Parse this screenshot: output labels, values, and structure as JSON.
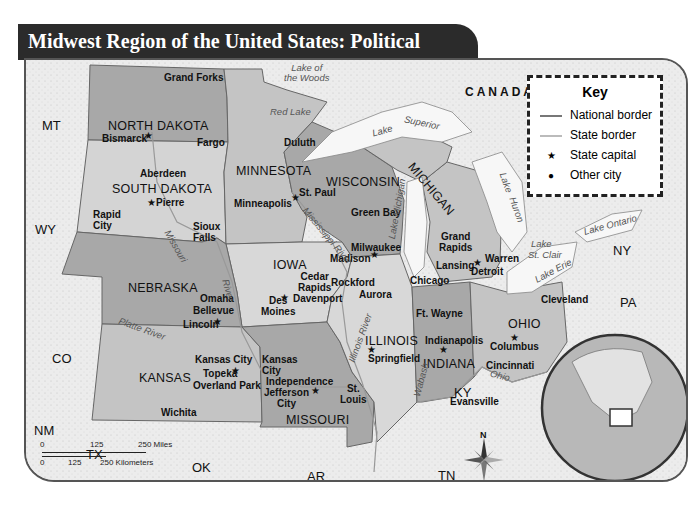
{
  "title": "Midwest Region of the United States: Political",
  "colors": {
    "title_bar": "#2b2b2b",
    "outside_land": "#ececec",
    "midwest_light": "#d6d6d6",
    "midwest_mid": "#bdbdbd",
    "midwest_dark": "#a3a3a3",
    "water": "#f7f7f7",
    "border": "#555555"
  },
  "key": {
    "title": "Key",
    "items": [
      {
        "symbol": "line-dark",
        "label": "National border"
      },
      {
        "symbol": "line-light",
        "label": "State border"
      },
      {
        "symbol": "star",
        "label": "State capital"
      },
      {
        "symbol": "dot",
        "label": "Other city"
      }
    ]
  },
  "country": "CANADA",
  "midwest_states": [
    "NORTH DAKOTA",
    "SOUTH DAKOTA",
    "MINNESOTA",
    "WISCONSIN",
    "MICHIGAN",
    "IOWA",
    "NEBRASKA",
    "KANSAS",
    "MISSOURI",
    "ILLINOIS",
    "INDIANA",
    "OHIO"
  ],
  "neighbor_states": [
    "MT",
    "WY",
    "CO",
    "NM",
    "TX",
    "OK",
    "AR",
    "TN",
    "KY",
    "PA",
    "NY"
  ],
  "capitals": [
    "Bismarck",
    "Pierre",
    "St. Paul",
    "Madison",
    "Lansing",
    "Des Moines",
    "Lincoln",
    "Topeka",
    "Jefferson City",
    "Springfield",
    "Indianapolis",
    "Columbus"
  ],
  "cities": [
    "Grand Forks",
    "Fargo",
    "Aberdeen",
    "Rapid City",
    "Sioux Falls",
    "Duluth",
    "Minneapolis",
    "Green Bay",
    "Milwaukee",
    "Grand Rapids",
    "Detroit",
    "Warren",
    "Cedar Rapids",
    "Davenport",
    "Rockford",
    "Aurora",
    "Chicago",
    "Omaha",
    "Bellevue",
    "Kansas City",
    "Overland Park",
    "Independence",
    "Wichita",
    "St. Louis",
    "Ft. Wayne",
    "Evansville",
    "Cincinnati",
    "Cleveland"
  ],
  "water_features": [
    "Lake of the Woods",
    "Red Lake",
    "Lake Superior",
    "Lake Michigan",
    "Lake Huron",
    "Lake St. Clair",
    "Lake Erie",
    "Lake Ontario",
    "Mississippi River",
    "Missouri River",
    "Platte River",
    "Illinois River",
    "Wabash",
    "Ohio River"
  ],
  "labels": {
    "MT": "MT",
    "WY": "WY",
    "CO": "CO",
    "NM": "NM",
    "TX": "TX",
    "OK": "OK",
    "AR": "AR",
    "TN": "TN",
    "KY": "KY",
    "PA": "PA",
    "NY": "NY",
    "ND": "NORTH DAKOTA",
    "SD": "SOUTH DAKOTA",
    "MN": "MINNESOTA",
    "WI": "WISCONSIN",
    "MI": "MICHIGAN",
    "IA": "IOWA",
    "NE": "NEBRASKA",
    "KS": "KANSAS",
    "MO": "MISSOURI",
    "IL": "ILLINOIS",
    "IN": "INDIANA",
    "OH": "OHIO",
    "grand_forks": "Grand Forks",
    "bismarck": "Bismarck",
    "fargo": "Fargo",
    "aberdeen": "Aberdeen",
    "pierre": "Pierre",
    "rapid": "Rapid",
    "city": "City",
    "sioux": "Sioux",
    "falls": "Falls",
    "duluth": "Duluth",
    "st_paul": "St. Paul",
    "minneapolis": "Minneapolis",
    "green_bay": "Green Bay",
    "milwaukee": "Milwaukee",
    "madison": "Madison",
    "grand": "Grand",
    "rapids": "Rapids",
    "lansing": "Lansing",
    "warren": "Warren",
    "detroit": "Detroit",
    "cedar": "Cedar",
    "des": "Des",
    "moines": "Moines",
    "davenport": "Davenport",
    "rockford": "Rockford",
    "aurora": "Aurora",
    "chicago": "Chicago",
    "omaha": "Omaha",
    "bellevue": "Bellevue",
    "lincoln": "Lincoln",
    "kansas_city": "Kansas City",
    "kansas": "Kansas",
    "topeka": "Topeka",
    "overland_park": "Overland Park",
    "independence": "Independence",
    "jefferson": "Jefferson",
    "wichita": "Wichita",
    "st": "St.",
    "louis": "Louis",
    "springfield": "Springfield",
    "ft_wayne": "Ft. Wayne",
    "indianapolis": "Indianapolis",
    "evansville": "Evansville",
    "columbus": "Columbus",
    "cincinnati": "Cincinnati",
    "cleveland": "Cleveland",
    "lake_of": "Lake of",
    "the_woods": "the Woods",
    "red_lake": "Red Lake",
    "lake": "Lake",
    "superior": "Superior",
    "lake_michigan": "Lake Michigan",
    "huron": "Huron",
    "st_clair": "St. Clair",
    "lake_erie": "Lake Erie",
    "lake_ontario": "Lake Ontario",
    "mississippi": "Mississippi River",
    "missouri": "Missouri",
    "river": "River",
    "platte": "Platte River",
    "illinois_river": "Illinois River",
    "wabash": "Wabash",
    "ohio": "Ohio"
  },
  "scale": {
    "miles": [
      "0",
      "125",
      "250 Miles"
    ],
    "km": [
      "0",
      "125",
      "250 Kilometers"
    ]
  },
  "compass": {
    "north_label": "N"
  }
}
